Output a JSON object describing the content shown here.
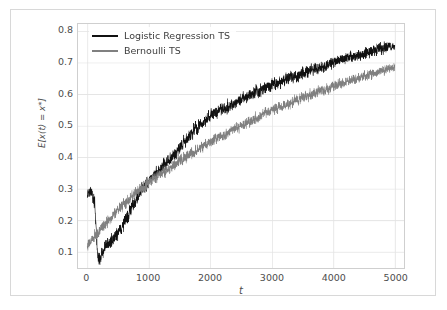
{
  "chart_data": {
    "type": "line",
    "title": "",
    "xlabel": "t",
    "ylabel": "E[x(t) = x*]",
    "xlim": [
      -150,
      5150
    ],
    "ylim": [
      0.048,
      0.822
    ],
    "grid": true,
    "legend_position": "upper left",
    "xticks": [
      0,
      1000,
      2000,
      3000,
      4000,
      5000
    ],
    "xtick_labels": [
      "0",
      "1000",
      "2000",
      "3000",
      "4000",
      "5000"
    ],
    "yticks": [
      0.1,
      0.2,
      0.3,
      0.4,
      0.5,
      0.6,
      0.7,
      0.8
    ],
    "ytick_labels": [
      "0.1",
      "0.2",
      "0.3",
      "0.4",
      "0.5",
      "0.6",
      "0.7",
      "0.8"
    ],
    "series": [
      {
        "name": "Logistic Regression TS",
        "color": "#111111",
        "noise": 0.022,
        "x": [
          0,
          60,
          120,
          170,
          210,
          260,
          320,
          400,
          480,
          560,
          660,
          760,
          880,
          1000,
          1150,
          1300,
          1450,
          1600,
          1750,
          1900,
          2050,
          2200,
          2350,
          2500,
          2700,
          2900,
          3100,
          3300,
          3500,
          3700,
          3900,
          4100,
          4300,
          4500,
          4700,
          4850,
          5000
        ],
        "values": [
          0.295,
          0.285,
          0.255,
          0.085,
          0.075,
          0.105,
          0.125,
          0.135,
          0.155,
          0.175,
          0.215,
          0.255,
          0.295,
          0.325,
          0.355,
          0.385,
          0.415,
          0.452,
          0.488,
          0.515,
          0.535,
          0.552,
          0.568,
          0.582,
          0.602,
          0.62,
          0.636,
          0.65,
          0.664,
          0.678,
          0.692,
          0.706,
          0.718,
          0.728,
          0.74,
          0.748,
          0.752
        ]
      },
      {
        "name": "Bernoulli TS",
        "color": "#808080",
        "noise": 0.019,
        "x": [
          0,
          60,
          120,
          200,
          300,
          400,
          500,
          620,
          760,
          900,
          1050,
          1200,
          1350,
          1500,
          1650,
          1800,
          1950,
          2100,
          2300,
          2500,
          2700,
          2900,
          3100,
          3300,
          3500,
          3700,
          3900,
          4100,
          4300,
          4500,
          4700,
          4850,
          5000
        ],
        "values": [
          0.118,
          0.135,
          0.15,
          0.168,
          0.19,
          0.212,
          0.232,
          0.255,
          0.282,
          0.305,
          0.328,
          0.348,
          0.368,
          0.388,
          0.406,
          0.424,
          0.442,
          0.458,
          0.48,
          0.5,
          0.52,
          0.538,
          0.556,
          0.572,
          0.588,
          0.602,
          0.616,
          0.63,
          0.644,
          0.656,
          0.668,
          0.676,
          0.682
        ]
      }
    ]
  },
  "legend": {
    "items": [
      {
        "label": "Logistic Regression TS",
        "color": "#111111"
      },
      {
        "label": "Bernoulli TS",
        "color": "#808080"
      }
    ]
  },
  "axes": {
    "xlabel": "t",
    "ylabel": "E[x(t) = x*]"
  }
}
